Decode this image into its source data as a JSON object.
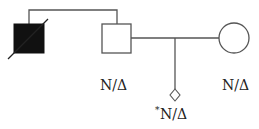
{
  "diagram": {
    "type": "pedigree",
    "colors": {
      "line": "#555555",
      "affected_fill": "#111111",
      "unaffected_fill": "#ffffff"
    },
    "individuals": [
      {
        "id": "grandfather",
        "shape": "square",
        "affected": true,
        "deceased": true,
        "label": ""
      },
      {
        "id": "father",
        "shape": "square",
        "affected": false,
        "deceased": false,
        "label": "N/Δ"
      },
      {
        "id": "mother",
        "shape": "circle",
        "affected": false,
        "deceased": false,
        "label": "N/Δ"
      },
      {
        "id": "fetus",
        "shape": "diamond",
        "affected": false,
        "deceased": false,
        "label_marker": "*",
        "label": "N/Δ"
      }
    ]
  }
}
